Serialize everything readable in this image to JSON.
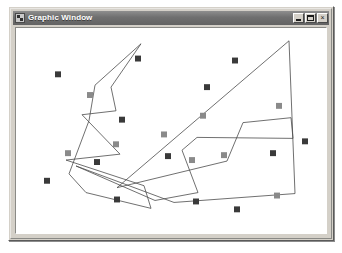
{
  "window": {
    "title": "Graphic Window",
    "icon": "graphic-window-icon",
    "background": "#d4d0c8",
    "titlebar_color": "#6f6f6f",
    "titlebar_text_color": "#ffffff",
    "controls": [
      {
        "name": "minimize-button",
        "label": "_",
        "glyph": "minimize"
      },
      {
        "name": "maximize-button",
        "label": "□",
        "glyph": "maximize"
      },
      {
        "name": "close-button",
        "label": "×",
        "glyph": "close"
      }
    ]
  },
  "canvas": {
    "background": "#ffffff",
    "width": 310,
    "height": 208,
    "stroke_color": "#4a4a4a",
    "stroke_width": 0.8,
    "marker_size": 6,
    "marker_dark_color": "#3a3a3a",
    "marker_gray_color": "#8a8a8a",
    "polygons": [
      {
        "name": "left-polygon",
        "fill": "none",
        "points": "125,16 79,58 73,94 53,148 70,167 135,183 128,160 50,134 104,128 66,88 100,84 95,60"
      },
      {
        "name": "right-polygon",
        "fill": "none",
        "points": "273,13 279,168 158,177 60,140 139,175 182,167 166,124 181,111 277,112 275,91 227,96 211,135 101,162"
      }
    ],
    "markers": [
      {
        "name": "point-marker",
        "x": 42,
        "y": 47,
        "shade": "dark"
      },
      {
        "name": "point-marker",
        "x": 122,
        "y": 31,
        "shade": "dark"
      },
      {
        "name": "point-marker",
        "x": 191,
        "y": 60,
        "shade": "dark"
      },
      {
        "name": "point-marker",
        "x": 219,
        "y": 33,
        "shade": "dark"
      },
      {
        "name": "point-marker",
        "x": 74,
        "y": 68,
        "shade": "gray"
      },
      {
        "name": "point-marker",
        "x": 187,
        "y": 89,
        "shade": "gray"
      },
      {
        "name": "point-marker",
        "x": 263,
        "y": 79,
        "shade": "gray"
      },
      {
        "name": "point-marker",
        "x": 106,
        "y": 93,
        "shade": "dark"
      },
      {
        "name": "point-marker",
        "x": 148,
        "y": 108,
        "shade": "gray"
      },
      {
        "name": "point-marker",
        "x": 289,
        "y": 115,
        "shade": "dark"
      },
      {
        "name": "point-marker",
        "x": 152,
        "y": 130,
        "shade": "dark"
      },
      {
        "name": "point-marker",
        "x": 176,
        "y": 134,
        "shade": "gray"
      },
      {
        "name": "point-marker",
        "x": 100,
        "y": 118,
        "shade": "gray"
      },
      {
        "name": "point-marker",
        "x": 81,
        "y": 136,
        "shade": "dark"
      },
      {
        "name": "point-marker",
        "x": 52,
        "y": 127,
        "shade": "gray"
      },
      {
        "name": "point-marker",
        "x": 31,
        "y": 155,
        "shade": "dark"
      },
      {
        "name": "point-marker",
        "x": 208,
        "y": 129,
        "shade": "gray"
      },
      {
        "name": "point-marker",
        "x": 257,
        "y": 127,
        "shade": "dark"
      },
      {
        "name": "point-marker",
        "x": 261,
        "y": 170,
        "shade": "gray"
      },
      {
        "name": "point-marker",
        "x": 101,
        "y": 174,
        "shade": "dark"
      },
      {
        "name": "point-marker",
        "x": 180,
        "y": 176,
        "shade": "dark"
      },
      {
        "name": "point-marker",
        "x": 221,
        "y": 184,
        "shade": "dark"
      }
    ]
  }
}
